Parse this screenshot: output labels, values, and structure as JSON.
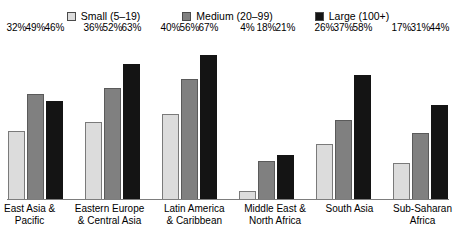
{
  "chart_data": {
    "type": "bar",
    "title": "",
    "xlabel": "",
    "ylabel": "",
    "ylim": [
      0,
      70
    ],
    "grid": false,
    "legend_position": "top-center",
    "value_suffix": "%",
    "categories": [
      "East Asia &\nPacific",
      "Eastern Europe\n& Central Asia",
      "Latin America\n& Caribbean",
      "Middle East &\nNorth Africa",
      "South Asia",
      "Sub-Saharan\nAfrica"
    ],
    "series": [
      {
        "name": "Small (5–19)",
        "color": "#dcdcdc",
        "values": [
          32,
          36,
          40,
          4,
          26,
          17
        ]
      },
      {
        "name": "Medium (20–99)",
        "color": "#808080",
        "values": [
          49,
          52,
          56,
          18,
          37,
          31
        ]
      },
      {
        "name": "Large (100+)",
        "color": "#141414",
        "values": [
          46,
          63,
          67,
          21,
          58,
          44
        ]
      }
    ],
    "data_labels": [
      [
        "32%",
        "49%",
        "46%"
      ],
      [
        "36%",
        "52%",
        "63%"
      ],
      [
        "40%",
        "56%",
        "67%"
      ],
      [
        "4%",
        "18%",
        "21%"
      ],
      [
        "26%",
        "37%",
        "58%"
      ],
      [
        "17%",
        "31%",
        "44%"
      ]
    ]
  },
  "legend": {
    "items": [
      {
        "label": "Small (5–19)",
        "color": "#dcdcdc"
      },
      {
        "label": "Medium (20–99)",
        "color": "#808080"
      },
      {
        "label": "Large (100+)",
        "color": "#141414"
      }
    ]
  },
  "categories": [
    {
      "line1": "East Asia &",
      "line2": "Pacific"
    },
    {
      "line1": "Eastern Europe",
      "line2": "& Central Asia"
    },
    {
      "line1": "Latin America",
      "line2": "& Caribbean"
    },
    {
      "line1": "Middle East &",
      "line2": "North Africa"
    },
    {
      "line1": "South Asia",
      "line2": ""
    },
    {
      "line1": "Sub-Saharan",
      "line2": "Africa"
    }
  ]
}
